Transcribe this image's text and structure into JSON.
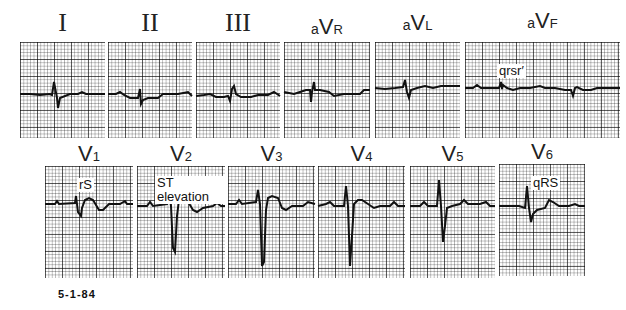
{
  "figure": {
    "date_label": "5-1-84",
    "trace_color": "#111111",
    "grid_color": "#555555"
  },
  "leads": {
    "limb": [
      {
        "id": "I",
        "label": "I"
      },
      {
        "id": "II",
        "label": "II"
      },
      {
        "id": "III",
        "label": "III"
      },
      {
        "id": "aVR",
        "prefix": "a",
        "main": "V",
        "sub": "R"
      },
      {
        "id": "aVL",
        "prefix": "a",
        "main": "V",
        "sub": "L"
      },
      {
        "id": "aVF",
        "prefix": "a",
        "main": "V",
        "sub": "F",
        "annotation": "qrsr′"
      }
    ],
    "precordial": [
      {
        "id": "V1",
        "main": "V",
        "sub": "1",
        "annotation": "rS"
      },
      {
        "id": "V2",
        "main": "V",
        "sub": "2",
        "annotation": "ST elevation"
      },
      {
        "id": "V3",
        "main": "V",
        "sub": "3"
      },
      {
        "id": "V4",
        "main": "V",
        "sub": "4"
      },
      {
        "id": "V5",
        "main": "V",
        "sub": "5"
      },
      {
        "id": "V6",
        "main": "V",
        "sub": "6",
        "annotation": "qRS"
      }
    ]
  }
}
